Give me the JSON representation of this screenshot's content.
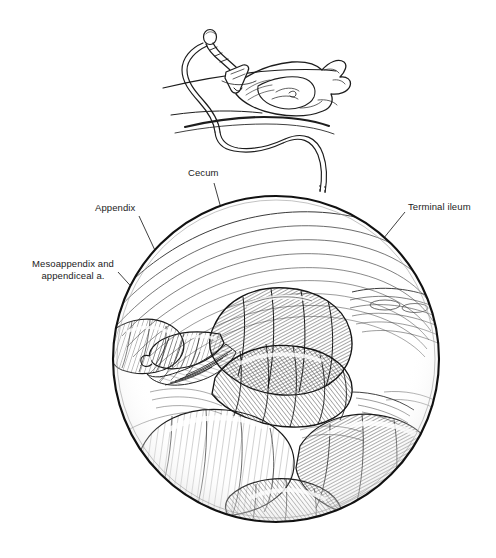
{
  "figure": {
    "kind": "medical-illustration",
    "technique": "pen-and-ink stipple / cross-hatch line art",
    "background_color": "#ffffff",
    "ink_color": "#1b1b1b",
    "width": 496,
    "height": 558
  },
  "inset": {
    "name": "patient-with-laparoscope-inset",
    "description": "Supine draped patient torso in lateral three-quarter view with a trocar and laparoscope inserted through the abdominal wall; a light/camera cable loops down and off the lower right of the inset.",
    "elements": [
      "laparoscope-shaft",
      "trocar-port",
      "light-cable",
      "abdominal-wall",
      "drape-fold"
    ]
  },
  "scope_view": {
    "name": "laparoscopic-circular-view",
    "description": "Circular endoscopic field of view filled with cross-hatched loops of bowel, omentum and peritoneal folds.",
    "center_x": 276,
    "center_y": 359,
    "radius": 164,
    "border_color": "#111111"
  },
  "labels": [
    {
      "id": "cecum",
      "text": "Cecum",
      "x": 188,
      "y": 167
    },
    {
      "id": "appendix",
      "text": "Appendix",
      "x": 95,
      "y": 202
    },
    {
      "id": "mesoappendix",
      "text": "Mesoappendix and\nappendiceal a.",
      "x": 21,
      "y": 258
    },
    {
      "id": "ileum",
      "text": "Terminal ileum",
      "x": 408,
      "y": 201
    }
  ],
  "leader_lines": [
    {
      "id": "leader-cecum",
      "from": [
        214,
        183
      ],
      "to": [
        258,
        342
      ]
    },
    {
      "id": "leader-appendix",
      "from": [
        139,
        216
      ],
      "to": [
        192,
        330
      ]
    },
    {
      "id": "leader-mesoappendix",
      "from": [
        118,
        272
      ],
      "to": [
        185,
        346
      ]
    },
    {
      "id": "leader-ileum",
      "from": [
        405,
        212
      ],
      "to": [
        309,
        330
      ]
    }
  ],
  "cable": {
    "id": "scope-cable",
    "description": "Fiber-optic cable running from the laparoscope handle down to the top edge of the circular scope view.",
    "from": [
      225,
      68
    ],
    "to": [
      320,
      192
    ]
  }
}
